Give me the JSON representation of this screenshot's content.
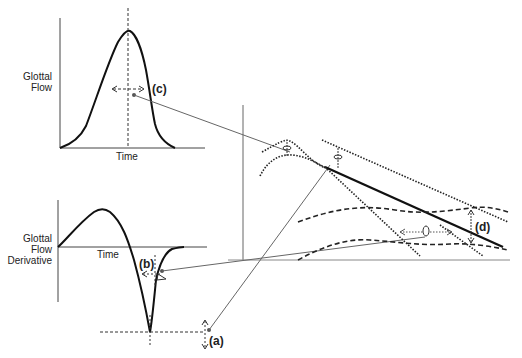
{
  "top_plot": {
    "ylabel_line1": "Glottal",
    "ylabel_line2": "Flow",
    "xlabel": "Time",
    "annotation": "(c)"
  },
  "bottom_plot": {
    "ylabel_line1": "Glottal",
    "ylabel_line2": "Flow",
    "ylabel_line3": "Derivative",
    "xlabel": "Time",
    "annotation_b": "(b)",
    "annotation_a": "(a)"
  },
  "spectrum_plot": {
    "annotation_d": "(d)"
  },
  "colors": {
    "ink": "#222222",
    "thin_line": "#555555"
  }
}
